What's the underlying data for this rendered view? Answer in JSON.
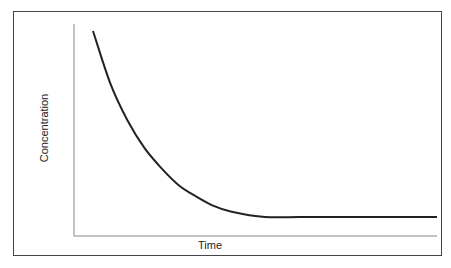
{
  "chart_data": {
    "type": "line",
    "title": "",
    "xlabel": "Time",
    "ylabel": "Concentration",
    "xticks": [],
    "yticks": [],
    "grid": false,
    "legend": null,
    "series": [
      {
        "name": "Concentration",
        "description": "Exponential decay that levels off to a constant plateau",
        "x": [
          0,
          0.05,
          0.1,
          0.15,
          0.2,
          0.25,
          0.3,
          0.35,
          0.4,
          0.5,
          0.6,
          0.7,
          0.8,
          0.9,
          1.0
        ],
        "values": [
          1.0,
          0.72,
          0.52,
          0.37,
          0.26,
          0.17,
          0.11,
          0.06,
          0.03,
          0.0,
          0.0,
          0.0,
          0.0,
          0.0,
          0.0
        ]
      }
    ],
    "colors": {
      "line": "#222222",
      "axes": "#888888",
      "frame": "#444444"
    }
  }
}
